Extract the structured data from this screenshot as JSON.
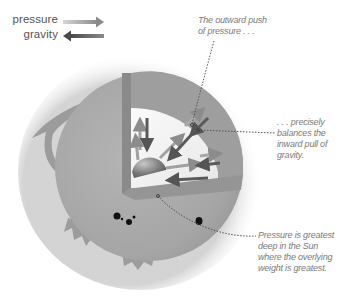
{
  "legend": {
    "items": [
      {
        "label": "pressure",
        "icon": "arrow-right-icon",
        "color": "#9a9a9a"
      },
      {
        "label": "gravity",
        "icon": "arrow-left-icon",
        "color": "#5a5a5a"
      }
    ]
  },
  "annotations": {
    "outward_push": {
      "lines": [
        "The outward push",
        "of pressure . . ."
      ]
    },
    "balances": {
      "lines": [
        ". . . precisely",
        "balances the",
        "inward pull of",
        "gravity."
      ]
    },
    "greatest": {
      "lines": [
        "Pressure is greatest",
        "deep in the Sun",
        "where the overlying",
        "weight is greatest."
      ]
    }
  },
  "diagram": {
    "colors": {
      "sphere": "#a8a8a8",
      "cutaway_wall": "#8e8e8e",
      "interior_light": "#f2f2f2",
      "core": "#7d7d7d",
      "leader_line": "#555555"
    }
  }
}
